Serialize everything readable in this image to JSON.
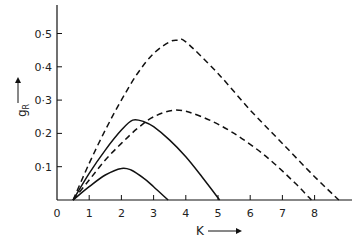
{
  "chart_data": {
    "type": "line",
    "title": "",
    "xlabel": "K",
    "ylabel": "gR",
    "xlim": [
      0,
      9
    ],
    "ylim": [
      0,
      0.55
    ],
    "grid": false,
    "legend": null,
    "x_ticks": [
      0,
      1,
      2,
      3,
      4,
      5,
      6,
      7,
      8
    ],
    "x_tick_labels": [
      "0",
      "1",
      "2",
      "3",
      "4",
      "5",
      "6",
      "7",
      "8"
    ],
    "y_ticks": [
      0.1,
      0.2,
      0.3,
      0.4,
      0.5
    ],
    "y_tick_labels": [
      "0·1",
      "0·2",
      "0·3",
      "0·4",
      "0·5"
    ],
    "series": [
      {
        "name": "dashed-upper",
        "style": "dashed",
        "x": [
          0.5,
          1,
          1.5,
          2,
          2.5,
          3,
          3.5,
          3.75,
          4,
          5,
          6,
          7,
          8,
          8.75
        ],
        "values": [
          0,
          0.11,
          0.21,
          0.3,
          0.38,
          0.44,
          0.475,
          0.48,
          0.475,
          0.38,
          0.27,
          0.17,
          0.07,
          0
        ]
      },
      {
        "name": "dashed-lower",
        "style": "dashed",
        "x": [
          0.5,
          1,
          1.5,
          2,
          2.5,
          3,
          3.7,
          4.5,
          5.5,
          6.5,
          7.4,
          7.9
        ],
        "values": [
          0,
          0.06,
          0.12,
          0.17,
          0.215,
          0.25,
          0.27,
          0.25,
          0.2,
          0.13,
          0.05,
          0
        ]
      },
      {
        "name": "solid-upper",
        "style": "solid",
        "x": [
          0.5,
          1,
          1.5,
          2,
          2.35,
          2.7,
          3,
          3.5,
          4,
          4.5,
          5.05
        ],
        "values": [
          0,
          0.08,
          0.15,
          0.21,
          0.24,
          0.235,
          0.22,
          0.18,
          0.13,
          0.07,
          0
        ]
      },
      {
        "name": "solid-lower",
        "style": "solid",
        "x": [
          0.5,
          1,
          1.5,
          2,
          2.3,
          2.7,
          3,
          3.45
        ],
        "values": [
          0,
          0.04,
          0.075,
          0.095,
          0.09,
          0.065,
          0.04,
          0
        ]
      }
    ]
  },
  "labels": {
    "xlabel": "K",
    "ylabel_main": "g",
    "ylabel_sub": "R"
  },
  "colors": {
    "ink": "#111111",
    "background": "#ffffff"
  }
}
